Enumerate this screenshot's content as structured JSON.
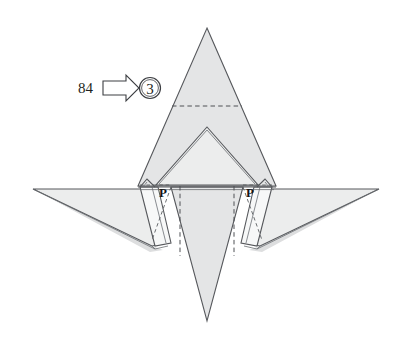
{
  "figure": {
    "kind": "origami-folding-diagram",
    "title_text": "",
    "background_color": "#ffffff",
    "paper_color": "#e7e8e9",
    "line_color": "#56585c",
    "crease_color": "#4e5155"
  },
  "annotation": {
    "reference_number": "84",
    "arrow_icon": "right-block-arrow-icon",
    "step_number": "3",
    "step_number_enclosure": "circle"
  },
  "point_labels": [
    {
      "id": "left",
      "text": "P",
      "x": 163,
      "y": 194
    },
    {
      "id": "right",
      "text": "P",
      "x": 250,
      "y": 194
    }
  ],
  "shape_geometry": {
    "top_spike": {
      "apex_x": 207,
      "apex_y": 28,
      "base_left_x": 138,
      "base_right_x": 276,
      "base_y": 186
    },
    "inner_triangle": {
      "apex_x": 207,
      "apex_y": 127,
      "base_left_x": 156,
      "base_right_x": 258,
      "base_y": 185
    },
    "bottom_spike": {
      "apex_x": 207,
      "apex_y": 321,
      "top_left_x": 171,
      "top_right_x": 243,
      "top_y": 187
    },
    "left_wing_tip": {
      "x": 33,
      "y": 189
    },
    "right_wing_tip": {
      "x": 379,
      "y": 189
    },
    "horizontal_crease_y": 106,
    "vertical_crease_left_x": 180,
    "vertical_crease_right_x": 234
  },
  "legend": {
    "valley_fold_style": "dashed",
    "edge_style": "solid"
  }
}
